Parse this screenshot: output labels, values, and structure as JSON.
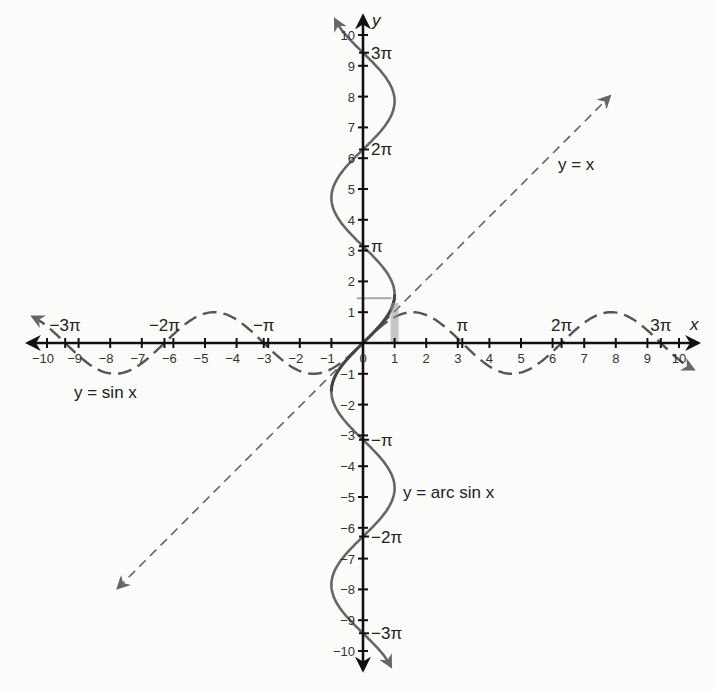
{
  "chart_data": {
    "type": "line",
    "title": "",
    "xlabel": "x",
    "ylabel": "y",
    "xlim": [
      -10,
      10
    ],
    "ylim": [
      -10,
      10
    ],
    "grid": false,
    "x_ticks": [
      -10,
      -9,
      -8,
      -7,
      -6,
      -5,
      -4,
      -3,
      -2,
      -1,
      0,
      1,
      2,
      3,
      4,
      5,
      6,
      7,
      8,
      9,
      10
    ],
    "y_ticks": [
      -10,
      -9,
      -8,
      -7,
      -6,
      -5,
      -4,
      -3,
      -2,
      -1,
      1,
      2,
      3,
      4,
      5,
      6,
      7,
      8,
      9,
      10
    ],
    "x_pi_labels": [
      {
        "value": -9.4248,
        "label": "−3π"
      },
      {
        "value": -6.2832,
        "label": "−2π"
      },
      {
        "value": -3.1416,
        "label": "−π"
      },
      {
        "value": 3.1416,
        "label": "π"
      },
      {
        "value": 6.2832,
        "label": "2π"
      },
      {
        "value": 9.4248,
        "label": "3π"
      }
    ],
    "y_pi_labels": [
      {
        "value": 9.4248,
        "label": "3π"
      },
      {
        "value": 6.2832,
        "label": "2π"
      },
      {
        "value": 3.1416,
        "label": "π"
      },
      {
        "value": -3.1416,
        "label": "−π"
      },
      {
        "value": -6.2832,
        "label": "−2π"
      },
      {
        "value": -9.4248,
        "label": "−3π"
      }
    ],
    "series": [
      {
        "name": "y = sin x",
        "style": "dashed",
        "function": "sin(x)",
        "domain": [
          -10.5,
          10.5
        ]
      },
      {
        "name": "y = x",
        "style": "dashed-thin",
        "function": "x",
        "domain": [
          -8,
          8
        ]
      },
      {
        "name": "y = arc sin x",
        "style": "solid",
        "function": "inverse relation x = sin(y)",
        "range": [
          -10.5,
          10.5
        ],
        "highlight_principal_branch": true
      }
    ],
    "annotations": [
      {
        "text": "y = sin x",
        "x": -7.5,
        "y": -1.6
      },
      {
        "text": "y = x",
        "x": 6.2,
        "y": 5.6
      },
      {
        "text": "y = arc sin x",
        "x": 1.3,
        "y": -4.8
      }
    ]
  },
  "labels": {
    "x_axis": "x",
    "y_axis": "y",
    "sin_label": "y = sin x",
    "line_label": "y = x",
    "arcsin_label": "y = arc sin x"
  }
}
